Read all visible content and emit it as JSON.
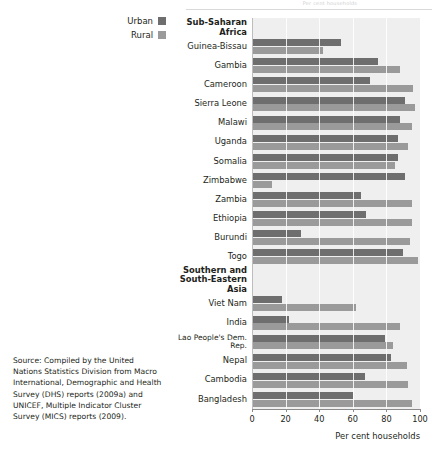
{
  "top_caption": "Per cent households",
  "legend": {
    "items": [
      {
        "label": "Urban",
        "color": "#6e6e6e"
      },
      {
        "label": "Rural",
        "color": "#9a9a9a"
      }
    ]
  },
  "source_note": "Source:  Compiled by the United Nations Statistics Division from Macro International, Demographic and Health Survey (DHS) reports (2009a) and UNICEF, Multiple Indicator Cluster Survey (MICS) reports (2009).",
  "chart_data": {
    "type": "bar",
    "orientation": "horizontal",
    "title": "",
    "xlabel": "Per cent households",
    "ylabel": "",
    "xlim": [
      0,
      100
    ],
    "xticks": [
      0,
      20,
      40,
      60,
      80,
      100
    ],
    "grid": true,
    "legend_position": "top-left",
    "plot_background": "#efefef",
    "series": [
      {
        "name": "Urban",
        "color": "#6e6e6e",
        "values": [
          53,
          75,
          70,
          91,
          88,
          87,
          87,
          91,
          65,
          68,
          29,
          90,
          18,
          22,
          79,
          83,
          67,
          60
        ]
      },
      {
        "name": "Rural",
        "color": "#9a9a9a",
        "values": [
          42,
          88,
          96,
          97,
          95,
          93,
          85,
          12,
          95,
          95,
          94,
          99,
          62,
          88,
          84,
          92,
          93,
          95
        ]
      }
    ],
    "categories": [
      "Guinea-Bissau",
      "Gambia",
      "Cameroon",
      "Sierra Leone",
      "Malawi",
      "Uganda",
      "Somalia",
      "Zimbabwe",
      "Zambia",
      "Ethiopia",
      "Burundi",
      "Togo",
      "Viet Nam",
      "India",
      "Lao People's Dem. Rep.",
      "Nepal",
      "Cambodia",
      "Bangladesh"
    ],
    "groups": [
      {
        "label": "Sub-Saharan Africa",
        "start": 0,
        "count": 12
      },
      {
        "label": "Southern and\nSouth-Eastern Asia",
        "start": 12,
        "count": 6
      }
    ],
    "rows": [
      {
        "kind": "group",
        "label": "Sub-Saharan Africa"
      },
      {
        "kind": "data",
        "label": "Guinea-Bissau",
        "urban": 53,
        "rural": 42
      },
      {
        "kind": "data",
        "label": "Gambia",
        "urban": 75,
        "rural": 88
      },
      {
        "kind": "data",
        "label": "Cameroon",
        "urban": 70,
        "rural": 96
      },
      {
        "kind": "data",
        "label": "Sierra Leone",
        "urban": 91,
        "rural": 97
      },
      {
        "kind": "data",
        "label": "Malawi",
        "urban": 88,
        "rural": 95
      },
      {
        "kind": "data",
        "label": "Uganda",
        "urban": 87,
        "rural": 93
      },
      {
        "kind": "data",
        "label": "Somalia",
        "urban": 87,
        "rural": 85
      },
      {
        "kind": "data",
        "label": "Zimbabwe",
        "urban": 91,
        "rural": 12
      },
      {
        "kind": "data",
        "label": "Zambia",
        "urban": 65,
        "rural": 95
      },
      {
        "kind": "data",
        "label": "Ethiopia",
        "urban": 68,
        "rural": 95
      },
      {
        "kind": "data",
        "label": "Burundi",
        "urban": 29,
        "rural": 94
      },
      {
        "kind": "data",
        "label": "Togo",
        "urban": 90,
        "rural": 99
      },
      {
        "kind": "group",
        "label": "Southern and\nSouth-Eastern Asia",
        "tall": true
      },
      {
        "kind": "data",
        "label": "Viet Nam",
        "urban": 18,
        "rural": 62
      },
      {
        "kind": "data",
        "label": "India",
        "urban": 22,
        "rural": 88
      },
      {
        "kind": "data",
        "label": "Lao People's Dem. Rep.",
        "urban": 79,
        "rural": 84,
        "tiny": true
      },
      {
        "kind": "data",
        "label": "Nepal",
        "urban": 83,
        "rural": 92
      },
      {
        "kind": "data",
        "label": "Cambodia",
        "urban": 67,
        "rural": 93
      },
      {
        "kind": "data",
        "label": "Bangladesh",
        "urban": 60,
        "rural": 95
      }
    ]
  }
}
